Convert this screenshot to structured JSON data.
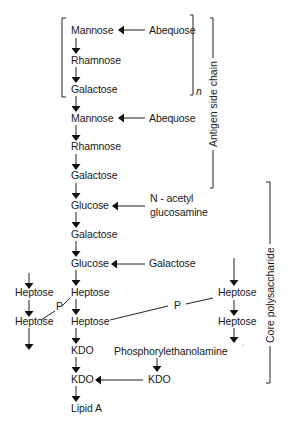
{
  "diagram": {
    "type": "lipopolysaccharide structure",
    "main_chain": [
      {
        "label": "Mannose"
      },
      {
        "label": "Rhamnose"
      },
      {
        "label": "Galactose"
      },
      {
        "label": "Mannose"
      },
      {
        "label": "Rhamnose"
      },
      {
        "label": "Galactose"
      },
      {
        "label": "Glucose"
      },
      {
        "label": "Galactose"
      },
      {
        "label": "Glucose"
      },
      {
        "label": "Heptose"
      },
      {
        "label": "Heptose"
      },
      {
        "label": "KDO"
      },
      {
        "label": "KDO"
      },
      {
        "label": "Lipid A"
      }
    ],
    "side_groups": {
      "abequose_1": "Abequose",
      "abequose_2": "Abequose",
      "nacetyl_line1": "N - acetyl",
      "nacetyl_line2": "glucosamine",
      "galactose_branch": "Galactose",
      "phosphorylethanolamine": "Phosphorylethanolamine",
      "kdo_branch": "KDO"
    },
    "left_branch": [
      "Heptose",
      "Heptose"
    ],
    "right_branch": [
      "Heptose",
      "Heptose"
    ],
    "phosphate_labels": [
      "P",
      "P"
    ],
    "repeat_subscript": "n",
    "brackets": {
      "antigen": "Antigen side chain",
      "core": "Core polysaccharide"
    }
  }
}
